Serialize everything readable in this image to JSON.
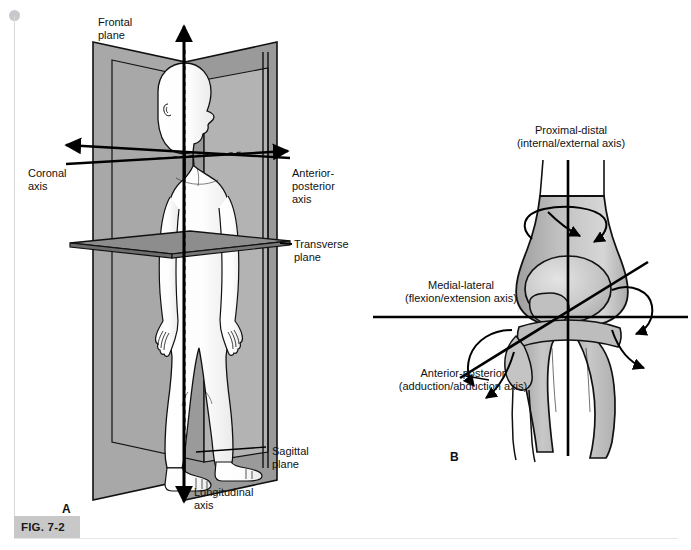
{
  "figure": {
    "caption_label": "FIG. 7-2",
    "panel_a_letter": "A",
    "panel_b_letter": "B"
  },
  "panel_a": {
    "title_role": "body-planes-and-axes",
    "labels": {
      "frontal_plane": "Frontal\nplane",
      "coronal_axis": "Coronal\naxis",
      "anterior_posterior_axis": "Anterior-\nposterior\naxis",
      "transverse_plane": "Transverse\nplane",
      "sagittal_plane": "Sagittal\nplane",
      "longitudinal_axis": "Longitudinal\naxis"
    },
    "colors": {
      "frontal_plane_fill": "#a9a9a9",
      "sagittal_plane_fill": "#c9c9c9",
      "transverse_plane_fill": "#8e8e8e",
      "transverse_plane_edge_fill": "#6f6f6f",
      "body_fill": "#fbfbfb",
      "body_shade": "#e2e2e2",
      "outline": "#111111"
    }
  },
  "panel_b": {
    "title_role": "knee-joint-axes",
    "labels": {
      "proximal_distal": "Proximal-distal\n(internal/external axis)",
      "medial_lateral": "Medial-lateral\n(flexion/extension axis)",
      "anterior_posterior": "Anterior-posterior\n(adduction/abduction axis)"
    },
    "colors": {
      "bone_fill": "#b4b4b4",
      "bone_fill_light": "#cfcfcf",
      "outline": "#111111",
      "axis": "#000000"
    }
  }
}
